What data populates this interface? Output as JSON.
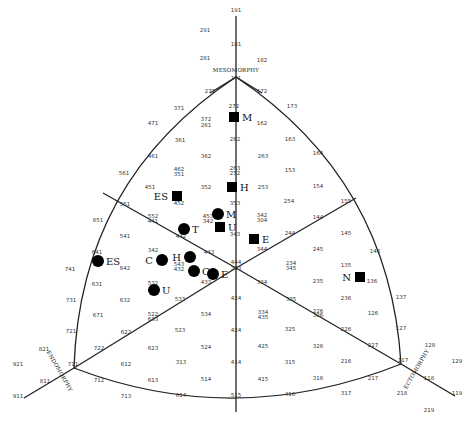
{
  "chart_data": {
    "type": "scatter",
    "subtype": "somatochart",
    "title": "",
    "axes": {
      "top": "MESOMORPHY",
      "left": "ENDOMORPHY",
      "right": "ECTOMORPHY"
    },
    "grid_labels": [
      {
        "t": "191",
        "x": 236,
        "y": 12
      },
      {
        "t": "291",
        "x": 205,
        "y": 32
      },
      {
        "t": "181",
        "x": 236,
        "y": 46
      },
      {
        "t": "281",
        "x": 205,
        "y": 60
      },
      {
        "t": "182",
        "x": 262,
        "y": 62
      },
      {
        "t": "171",
        "x": 236,
        "y": 80
      },
      {
        "t": "271",
        "x": 210,
        "y": 93
      },
      {
        "t": "172",
        "x": 262,
        "y": 93
      },
      {
        "t": "272",
        "x": 234,
        "y": 108
      },
      {
        "t": "371",
        "x": 179,
        "y": 110
      },
      {
        "t": "173",
        "x": 292,
        "y": 108
      },
      {
        "t": "471",
        "x": 153,
        "y": 125
      },
      {
        "t": "372",
        "x": 206,
        "y": 121
      },
      {
        "t": "261",
        "x": 206,
        "y": 127
      },
      {
        "t": "162",
        "x": 262,
        "y": 125
      },
      {
        "t": "361",
        "x": 180,
        "y": 142
      },
      {
        "t": "262",
        "x": 235,
        "y": 141
      },
      {
        "t": "163",
        "x": 290,
        "y": 141
      },
      {
        "t": "461",
        "x": 153,
        "y": 158
      },
      {
        "t": "362",
        "x": 206,
        "y": 158
      },
      {
        "t": "263",
        "x": 263,
        "y": 158
      },
      {
        "t": "164",
        "x": 318,
        "y": 155
      },
      {
        "t": "462",
        "x": 179,
        "y": 171
      },
      {
        "t": "351",
        "x": 179,
        "y": 176
      },
      {
        "t": "263",
        "x": 235,
        "y": 170
      },
      {
        "t": "252",
        "x": 235,
        "y": 175
      },
      {
        "t": "153",
        "x": 290,
        "y": 172
      },
      {
        "t": "561",
        "x": 124,
        "y": 175
      },
      {
        "t": "451",
        "x": 150,
        "y": 189
      },
      {
        "t": "352",
        "x": 206,
        "y": 189
      },
      {
        "t": "253",
        "x": 263,
        "y": 189
      },
      {
        "t": "154",
        "x": 318,
        "y": 188
      },
      {
        "t": "452",
        "x": 179,
        "y": 205
      },
      {
        "t": "353",
        "x": 235,
        "y": 205
      },
      {
        "t": "254",
        "x": 289,
        "y": 203
      },
      {
        "t": "155",
        "x": 346,
        "y": 203
      },
      {
        "t": "551",
        "x": 125,
        "y": 206
      },
      {
        "t": "453",
        "x": 208,
        "y": 218
      },
      {
        "t": "342",
        "x": 208,
        "y": 223
      },
      {
        "t": "552",
        "x": 153,
        "y": 218
      },
      {
        "t": "441",
        "x": 153,
        "y": 223
      },
      {
        "t": "342",
        "x": 262,
        "y": 217
      },
      {
        "t": "304",
        "x": 262,
        "y": 222
      },
      {
        "t": "144",
        "x": 318,
        "y": 219
      },
      {
        "t": "651",
        "x": 98,
        "y": 222
      },
      {
        "t": "343",
        "x": 235,
        "y": 236
      },
      {
        "t": "541",
        "x": 125,
        "y": 238
      },
      {
        "t": "442",
        "x": 181,
        "y": 238
      },
      {
        "t": "244",
        "x": 290,
        "y": 235
      },
      {
        "t": "145",
        "x": 346,
        "y": 235
      },
      {
        "t": "342",
        "x": 153,
        "y": 252
      },
      {
        "t": "443",
        "x": 209,
        "y": 254
      },
      {
        "t": "344",
        "x": 262,
        "y": 251
      },
      {
        "t": "245",
        "x": 318,
        "y": 251
      },
      {
        "t": "146",
        "x": 375,
        "y": 253
      },
      {
        "t": "641",
        "x": 97,
        "y": 254
      },
      {
        "t": "543",
        "x": 179,
        "y": 266
      },
      {
        "t": "432",
        "x": 179,
        "y": 271
      },
      {
        "t": "444",
        "x": 236,
        "y": 264
      },
      {
        "t": "333",
        "x": 236,
        "y": 270
      },
      {
        "t": "234",
        "x": 291,
        "y": 265
      },
      {
        "t": "345",
        "x": 291,
        "y": 270
      },
      {
        "t": "135",
        "x": 346,
        "y": 267
      },
      {
        "t": "741",
        "x": 70,
        "y": 271
      },
      {
        "t": "642",
        "x": 125,
        "y": 270
      },
      {
        "t": "433",
        "x": 206,
        "y": 284
      },
      {
        "t": "334",
        "x": 262,
        "y": 284
      },
      {
        "t": "235",
        "x": 318,
        "y": 283
      },
      {
        "t": "136",
        "x": 372,
        "y": 283
      },
      {
        "t": "631",
        "x": 97,
        "y": 286
      },
      {
        "t": "532",
        "x": 153,
        "y": 285
      },
      {
        "t": "632",
        "x": 125,
        "y": 302
      },
      {
        "t": "533",
        "x": 180,
        "y": 301
      },
      {
        "t": "424",
        "x": 236,
        "y": 300
      },
      {
        "t": "335",
        "x": 291,
        "y": 301
      },
      {
        "t": "236",
        "x": 346,
        "y": 300
      },
      {
        "t": "731",
        "x": 71,
        "y": 302
      },
      {
        "t": "137",
        "x": 401,
        "y": 299
      },
      {
        "t": "671",
        "x": 98,
        "y": 317
      },
      {
        "t": "522",
        "x": 153,
        "y": 316
      },
      {
        "t": "633",
        "x": 153,
        "y": 321
      },
      {
        "t": "534",
        "x": 206,
        "y": 316
      },
      {
        "t": "334",
        "x": 263,
        "y": 314
      },
      {
        "t": "435",
        "x": 263,
        "y": 319
      },
      {
        "t": "226",
        "x": 318,
        "y": 313
      },
      {
        "t": "326",
        "x": 318,
        "y": 317
      },
      {
        "t": "126",
        "x": 373,
        "y": 315
      },
      {
        "t": "721",
        "x": 71,
        "y": 333
      },
      {
        "t": "622",
        "x": 126,
        "y": 334
      },
      {
        "t": "523",
        "x": 180,
        "y": 332
      },
      {
        "t": "424",
        "x": 236,
        "y": 332
      },
      {
        "t": "325",
        "x": 290,
        "y": 331
      },
      {
        "t": "226",
        "x": 346,
        "y": 331
      },
      {
        "t": "127",
        "x": 401,
        "y": 330
      },
      {
        "t": "821",
        "x": 44,
        "y": 351
      },
      {
        "t": "722",
        "x": 99,
        "y": 350
      },
      {
        "t": "623",
        "x": 153,
        "y": 350
      },
      {
        "t": "524",
        "x": 206,
        "y": 349
      },
      {
        "t": "425",
        "x": 263,
        "y": 348
      },
      {
        "t": "326",
        "x": 318,
        "y": 348
      },
      {
        "t": "227",
        "x": 373,
        "y": 347
      },
      {
        "t": "128",
        "x": 430,
        "y": 347
      },
      {
        "t": "921",
        "x": 18,
        "y": 366
      },
      {
        "t": "711",
        "x": 73,
        "y": 366
      },
      {
        "t": "612",
        "x": 126,
        "y": 366
      },
      {
        "t": "313",
        "x": 181,
        "y": 364
      },
      {
        "t": "414",
        "x": 236,
        "y": 364
      },
      {
        "t": "315",
        "x": 290,
        "y": 364
      },
      {
        "t": "216",
        "x": 346,
        "y": 363
      },
      {
        "t": "117",
        "x": 403,
        "y": 362
      },
      {
        "t": "129",
        "x": 457,
        "y": 363
      },
      {
        "t": "811",
        "x": 45,
        "y": 383
      },
      {
        "t": "712",
        "x": 99,
        "y": 382
      },
      {
        "t": "613",
        "x": 153,
        "y": 382
      },
      {
        "t": "514",
        "x": 206,
        "y": 381
      },
      {
        "t": "415",
        "x": 263,
        "y": 381
      },
      {
        "t": "316",
        "x": 318,
        "y": 380
      },
      {
        "t": "217",
        "x": 373,
        "y": 380
      },
      {
        "t": "118",
        "x": 429,
        "y": 380
      },
      {
        "t": "911",
        "x": 18,
        "y": 398
      },
      {
        "t": "713",
        "x": 126,
        "y": 398
      },
      {
        "t": "614",
        "x": 181,
        "y": 397
      },
      {
        "t": "515",
        "x": 236,
        "y": 397
      },
      {
        "t": "416",
        "x": 290,
        "y": 396
      },
      {
        "t": "317",
        "x": 346,
        "y": 395
      },
      {
        "t": "218",
        "x": 402,
        "y": 395
      },
      {
        "t": "119",
        "x": 457,
        "y": 395
      },
      {
        "t": "219",
        "x": 429,
        "y": 412
      }
    ],
    "series": [
      {
        "name": "Square markers",
        "marker": "square",
        "points": [
          {
            "label": "M",
            "x": 234,
            "y": 117
          },
          {
            "label": "H",
            "x": 232,
            "y": 187
          },
          {
            "label": "ES",
            "x": 177,
            "y": 196
          },
          {
            "label": "U",
            "x": 220,
            "y": 227
          },
          {
            "label": "E",
            "x": 254,
            "y": 239
          },
          {
            "label": "N",
            "x": 360,
            "y": 277
          }
        ]
      },
      {
        "name": "Circle markers",
        "marker": "circle",
        "points": [
          {
            "label": "M",
            "x": 218,
            "y": 214
          },
          {
            "label": "T",
            "x": 184,
            "y": 229
          },
          {
            "label": "ES",
            "x": 98,
            "y": 261
          },
          {
            "label": "C",
            "x": 162,
            "y": 260
          },
          {
            "label": "H",
            "x": 190,
            "y": 257
          },
          {
            "label": "CA",
            "x": 194,
            "y": 271
          },
          {
            "label": "E",
            "x": 213,
            "y": 274
          },
          {
            "label": "U",
            "x": 154,
            "y": 290
          }
        ]
      }
    ],
    "grid": false,
    "legend": null
  }
}
